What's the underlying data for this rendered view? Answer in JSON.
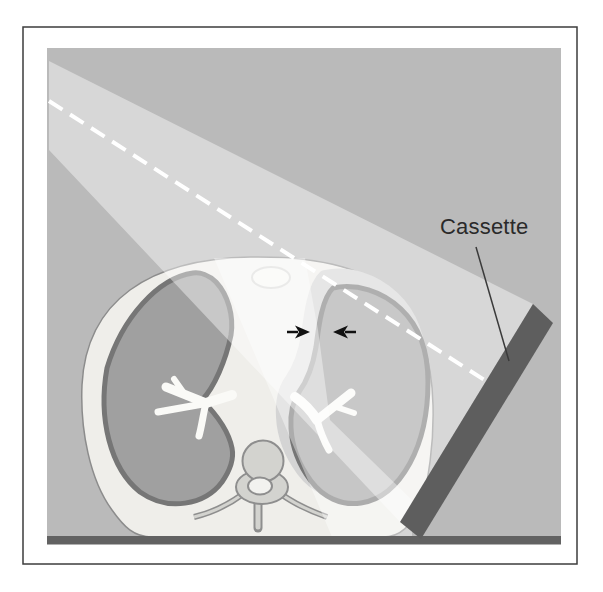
{
  "figure": {
    "kind": "radiography-technique-illustration",
    "description_labels": {
      "cassette": "Cassette"
    }
  },
  "colors": {
    "page_bg": "#ffffff",
    "frame_stroke": "#3d3d3d",
    "panel_bg": "#bababa",
    "body_fill": "#efeeea",
    "body_stroke": "#8c8c8c",
    "lung_fill": "#a0a0a0",
    "lung_stroke": "#767676",
    "pleural_air_fill": "#d4d4d4",
    "sternum_fill": "#f3f3f0",
    "sternum_stroke": "#c5c5c2",
    "bronchi_fill": "#fafaf7",
    "vertebra_fill": "#d3d3cf",
    "vertebra_stroke": "#8e8e8e",
    "vertebra_canal_fill": "#f2f2ef",
    "beam_fill": "#ffffff",
    "central_ray": "#ffffff",
    "cassette_fill": "#5e5e5e",
    "table_fill": "#626262",
    "arrow_color": "#111111",
    "leader_color": "#3a3a3a",
    "label_color": "#2a2a2a"
  }
}
